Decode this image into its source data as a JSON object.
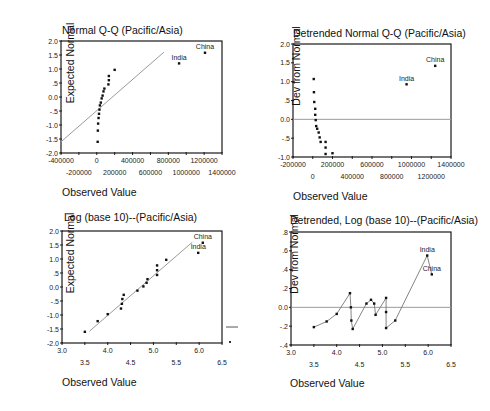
{
  "chart_data": [
    {
      "id": "qq",
      "type": "scatter",
      "title": "Normal Q-Q (Pacific/Asia)",
      "xlabel": "Observed Value",
      "ylabel": "Expected Normal",
      "xlim": [
        -400000,
        1400000
      ],
      "ylim": [
        -2.0,
        2.0
      ],
      "x_ticks_row1": [
        "-400000",
        "0",
        "400000",
        "800000",
        "1200000"
      ],
      "x_ticks_row1_values": [
        -400000,
        0,
        400000,
        800000,
        1200000
      ],
      "x_ticks_row2": [
        "-200000",
        "200000",
        "600000",
        "1000000",
        "1400000"
      ],
      "x_ticks_row2_values": [
        -200000,
        200000,
        600000,
        1000000,
        1400000
      ],
      "y_ticks": [
        "2.0",
        "1.5",
        "1.0",
        ".5",
        "0.0",
        "-.5",
        "-1.0",
        "-1.5",
        "-2.0"
      ],
      "y_ticks_values": [
        2.0,
        1.5,
        1.0,
        0.5,
        0.0,
        -0.5,
        -1.0,
        -1.5,
        -2.0
      ],
      "grid": false,
      "reference_line": {
        "x1": -400000,
        "y1": -1.6,
        "x2": 750000,
        "y2": 1.6
      },
      "points": [
        {
          "x": 10000,
          "y": -1.6
        },
        {
          "x": 12000,
          "y": -1.2
        },
        {
          "x": 15000,
          "y": -0.95
        },
        {
          "x": 20000,
          "y": -0.75
        },
        {
          "x": 25000,
          "y": -0.6
        },
        {
          "x": 30000,
          "y": -0.45
        },
        {
          "x": 35000,
          "y": -0.3
        },
        {
          "x": 45000,
          "y": -0.2
        },
        {
          "x": 55000,
          "y": -0.05
        },
        {
          "x": 65000,
          "y": 0.05
        },
        {
          "x": 75000,
          "y": 0.2
        },
        {
          "x": 85000,
          "y": 0.3
        },
        {
          "x": 130000,
          "y": 0.45
        },
        {
          "x": 135000,
          "y": 0.6
        },
        {
          "x": 135000,
          "y": 0.75
        },
        {
          "x": 200000,
          "y": 0.97
        },
        {
          "x": 920000,
          "y": 1.2,
          "label": "India"
        },
        {
          "x": 1210000,
          "y": 1.58,
          "label": "China"
        }
      ]
    },
    {
      "id": "detrended-qq",
      "type": "scatter",
      "title": "Detrended Normal Q-Q (Pacific/Asia)",
      "xlabel": "Observed Value",
      "ylabel": "Dev from Normal",
      "xlim": [
        -200000,
        1400000
      ],
      "ylim": [
        -1.0,
        2.0
      ],
      "x_ticks_row1": [
        "-200000",
        "200000",
        "600000",
        "1000000",
        "1400000"
      ],
      "x_ticks_row1_values": [
        -200000,
        200000,
        600000,
        1000000,
        1400000
      ],
      "x_ticks_row2": [
        "0",
        "400000",
        "800000",
        "1200000"
      ],
      "x_ticks_row2_values": [
        0,
        400000,
        800000,
        1200000
      ],
      "y_ticks": [
        "2.0",
        "1.5",
        "1.0",
        ".5",
        "0.0",
        "-.5",
        "-1.0"
      ],
      "y_ticks_values": [
        2.0,
        1.5,
        1.0,
        0.5,
        0.0,
        -0.5,
        -1.0
      ],
      "grid": false,
      "zero_line": true,
      "points": [
        {
          "x": 10000,
          "y": 1.07
        },
        {
          "x": 12000,
          "y": 0.72
        },
        {
          "x": 15000,
          "y": 0.46
        },
        {
          "x": 25000,
          "y": 0.28
        },
        {
          "x": 25000,
          "y": 0.12
        },
        {
          "x": 30000,
          "y": -0.02
        },
        {
          "x": 35000,
          "y": -0.18
        },
        {
          "x": 45000,
          "y": -0.25
        },
        {
          "x": 60000,
          "y": -0.35
        },
        {
          "x": 70000,
          "y": -0.48
        },
        {
          "x": 80000,
          "y": -0.6
        },
        {
          "x": 130000,
          "y": -0.6
        },
        {
          "x": 130000,
          "y": -0.75
        },
        {
          "x": 130000,
          "y": -0.92
        },
        {
          "x": 200000,
          "y": -0.9
        },
        {
          "x": 950000,
          "y": 0.93,
          "label": "India"
        },
        {
          "x": 1240000,
          "y": 1.42,
          "label": "China"
        }
      ]
    },
    {
      "id": "log-qq",
      "type": "scatter",
      "title": "Log (base 10)--(Pacific/Asia)",
      "xlabel": "Observed Value",
      "ylabel": "Expected Normal",
      "xlim": [
        3.0,
        6.5
      ],
      "ylim": [
        -2.0,
        2.0
      ],
      "x_ticks_row1": [
        "3.0",
        "4.0",
        "5.0",
        "6.0"
      ],
      "x_ticks_row1_values": [
        3.0,
        4.0,
        5.0,
        6.0
      ],
      "x_ticks_row2": [
        "3.5",
        "4.5",
        "5.5",
        "6.5"
      ],
      "x_ticks_row2_values": [
        3.5,
        4.5,
        5.5,
        6.5
      ],
      "y_ticks": [
        "2.0",
        "1.5",
        "1.0",
        ".5",
        "0.0",
        "-.5",
        "-1.0",
        "-1.5",
        "-2.0"
      ],
      "y_ticks_values": [
        2.0,
        1.5,
        1.0,
        0.5,
        0.0,
        -0.5,
        -1.0,
        -1.5,
        -2.0
      ],
      "grid": false,
      "reference_line": {
        "x1": 3.6,
        "y1": -1.58,
        "x2": 5.85,
        "y2": 1.6
      },
      "points": [
        {
          "x": 3.5,
          "y": -1.6
        },
        {
          "x": 3.78,
          "y": -1.22
        },
        {
          "x": 4.0,
          "y": -0.97
        },
        {
          "x": 4.29,
          "y": -0.77
        },
        {
          "x": 4.31,
          "y": -0.6
        },
        {
          "x": 4.32,
          "y": -0.43
        },
        {
          "x": 4.35,
          "y": -0.28
        },
        {
          "x": 4.65,
          "y": -0.13
        },
        {
          "x": 4.78,
          "y": 0.02
        },
        {
          "x": 4.85,
          "y": 0.15
        },
        {
          "x": 4.87,
          "y": 0.28
        },
        {
          "x": 5.08,
          "y": 0.43
        },
        {
          "x": 5.08,
          "y": 0.6
        },
        {
          "x": 5.08,
          "y": 0.77
        },
        {
          "x": 5.28,
          "y": 0.97
        },
        {
          "x": 5.98,
          "y": 1.22,
          "label": "India"
        },
        {
          "x": 6.08,
          "y": 1.58,
          "label": "China"
        }
      ]
    },
    {
      "id": "detrended-log-qq",
      "type": "line",
      "title": "Detrended, Log (base 10)--(Pacific/Asia)",
      "xlabel": "Observed Value",
      "ylabel": "Dev from Normal",
      "xlim": [
        3.0,
        6.5
      ],
      "ylim": [
        -0.4,
        0.8
      ],
      "x_ticks_row1": [
        "3.0",
        "4.0",
        "5.0",
        "6.0"
      ],
      "x_ticks_row1_values": [
        3.0,
        4.0,
        5.0,
        6.0
      ],
      "x_ticks_row2": [
        "3.5",
        "4.5",
        "5.5",
        "6.5"
      ],
      "x_ticks_row2_values": [
        3.5,
        4.5,
        5.5,
        6.5
      ],
      "y_ticks": [
        ".8",
        ".6",
        ".4",
        ".2",
        "0.0",
        "-.2",
        "-.4"
      ],
      "y_ticks_values": [
        0.8,
        0.6,
        0.4,
        0.2,
        0.0,
        -0.2,
        -0.4
      ],
      "grid": false,
      "zero_line": true,
      "points": [
        {
          "x": 3.5,
          "y": -0.21
        },
        {
          "x": 3.78,
          "y": -0.15
        },
        {
          "x": 4.0,
          "y": -0.07
        },
        {
          "x": 4.29,
          "y": 0.15
        },
        {
          "x": 4.31,
          "y": 0.0
        },
        {
          "x": 4.32,
          "y": -0.14
        },
        {
          "x": 4.35,
          "y": -0.23
        },
        {
          "x": 4.65,
          "y": 0.04
        },
        {
          "x": 4.75,
          "y": 0.08
        },
        {
          "x": 4.82,
          "y": 0.04
        },
        {
          "x": 4.85,
          "y": -0.08
        },
        {
          "x": 5.08,
          "y": 0.1
        },
        {
          "x": 5.08,
          "y": -0.05
        },
        {
          "x": 5.08,
          "y": -0.22
        },
        {
          "x": 5.28,
          "y": -0.14
        },
        {
          "x": 5.98,
          "y": 0.55,
          "label": "India"
        },
        {
          "x": 6.08,
          "y": 0.35,
          "label": "China"
        }
      ]
    }
  ],
  "layout": {
    "panels": [
      {
        "frame": {
          "left": 61,
          "top": 41,
          "right": 222,
          "bottom": 153
        },
        "title_pos": [
          62,
          24
        ],
        "ylabel_center": [
          36,
          97
        ],
        "xlabel_pos": [
          62,
          186
        ]
      },
      {
        "frame": {
          "left": 293,
          "top": 44,
          "right": 451,
          "bottom": 157
        },
        "title_pos": [
          293,
          27
        ],
        "ylabel_center": [
          262,
          100
        ],
        "xlabel_pos": [
          293,
          190
        ]
      },
      {
        "frame": {
          "left": 62,
          "top": 231,
          "right": 222,
          "bottom": 343
        },
        "title_pos": [
          64,
          211
        ],
        "ylabel_center": [
          36,
          287
        ],
        "xlabel_pos": [
          62,
          376
        ]
      },
      {
        "frame": {
          "left": 291,
          "top": 232,
          "right": 451,
          "bottom": 345
        },
        "title_pos": [
          290,
          214
        ],
        "ylabel_center": [
          260,
          288
        ],
        "xlabel_pos": [
          290,
          377
        ]
      }
    ],
    "stray_mark": {
      "line": [
        226,
        327,
        238,
        327
      ],
      "dot": [
        230,
        342
      ]
    },
    "colors": {
      "frame": "#1a1a1a",
      "ref_line": "#9a9a9a",
      "points": "#111111",
      "line": "#777777"
    }
  }
}
